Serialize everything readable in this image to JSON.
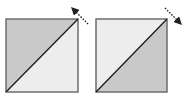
{
  "diagram": {
    "colors": {
      "dark_fill": "#c9c9c9",
      "light_fill": "#ededed",
      "border": "#6e6e6e",
      "diagonal": "#1a1a1a",
      "arrow": "#222222"
    },
    "blocks": [
      {
        "name": "left-block",
        "dark_triangle": "upper-left",
        "arrow_direction": "up-left"
      },
      {
        "name": "right-block",
        "dark_triangle": "lower-right",
        "arrow_direction": "down-right"
      }
    ]
  }
}
